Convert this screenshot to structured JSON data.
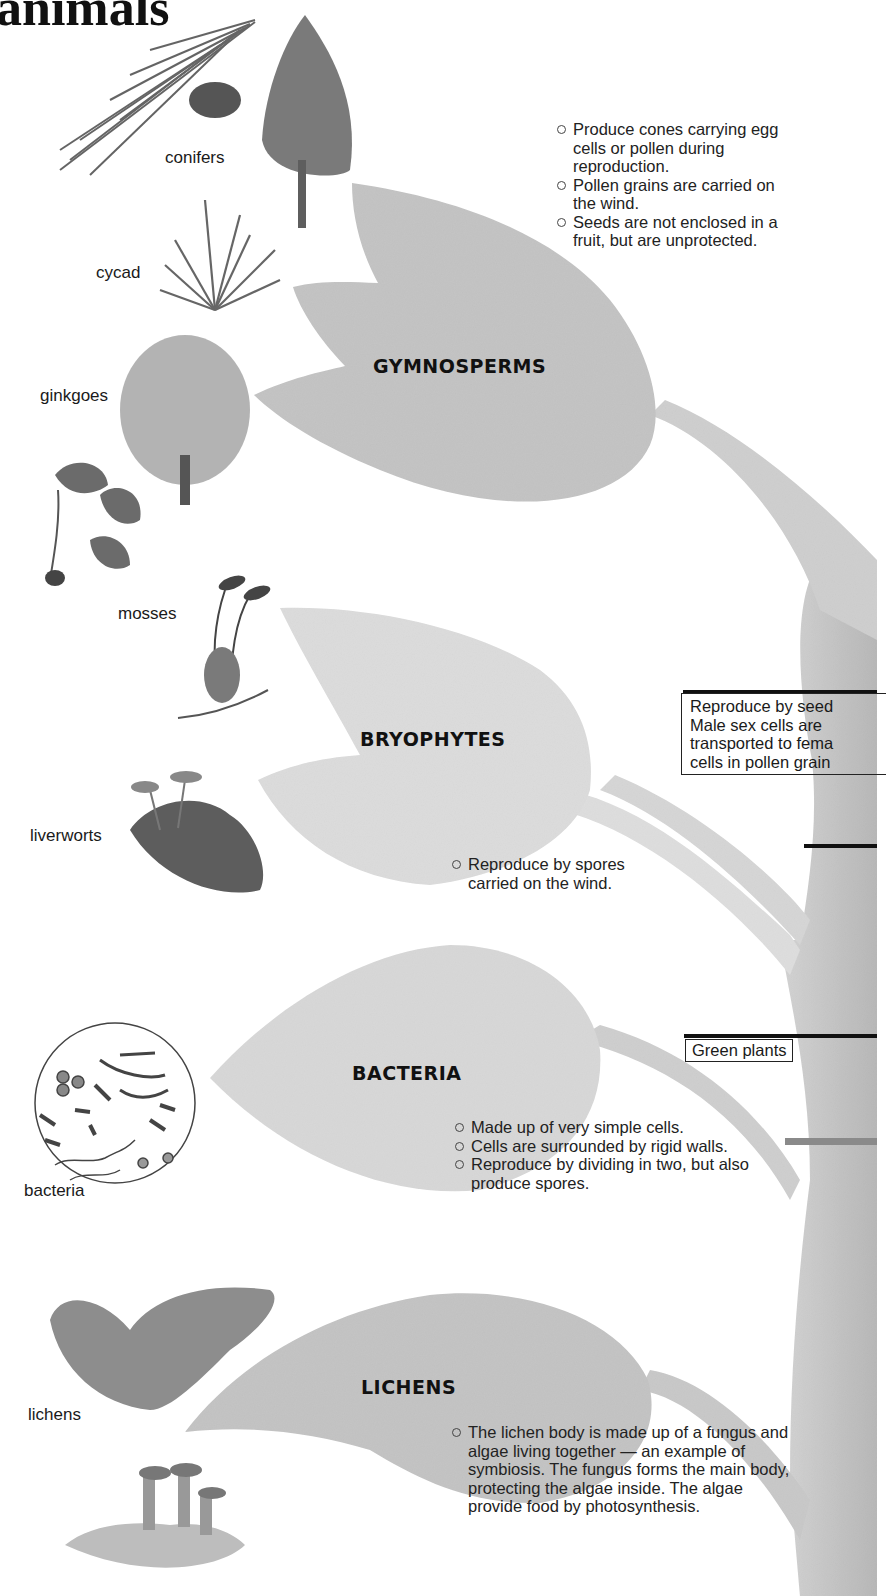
{
  "page": {
    "title_fragment": "animals"
  },
  "groups": [
    {
      "heading": "GYMNOSPERMS",
      "specimens": [
        "conifers",
        "cycad",
        "ginkgoes"
      ],
      "notes": [
        "Produce cones carrying egg cells or pollen during reproduction.",
        "Pollen grains are carried on the wind.",
        "Seeds are not enclosed in a fruit, but are unprotected."
      ]
    },
    {
      "heading": "BRYOPHYTES",
      "specimens": [
        "mosses",
        "liverworts"
      ],
      "notes": [
        "Reproduce by spores carried on the wind."
      ]
    },
    {
      "heading": "BACTERIA",
      "specimens": [
        "bacteria"
      ],
      "notes": [
        "Made up of very simple cells.",
        "Cells are surrounded by rigid walls.",
        "Reproduce by dividing in two, but also produce spores."
      ]
    },
    {
      "heading": "LICHENS",
      "specimens": [
        "lichens"
      ],
      "notes": [
        "The lichen body is made up of a fungus and algae living together — an example of symbiosis. The fungus forms the main body, protecting the algae inside. The algae provide food by photosynthesis."
      ]
    }
  ],
  "callouts": {
    "seed_plants": {
      "lines": [
        "Reproduce by seed",
        "Male sex cells are",
        "transported to fema",
        "cells in pollen grain"
      ]
    },
    "green_plants": {
      "label": "Green plants"
    }
  },
  "colors": {
    "leaf_gymnosperm": "#c2c2c2",
    "leaf_bryophyte": "#dadada",
    "leaf_bacteria": "#d8d8d8",
    "leaf_lichen": "#c4c4c4",
    "trunk": "#c8c8c8",
    "text": "#1a1a1a"
  }
}
